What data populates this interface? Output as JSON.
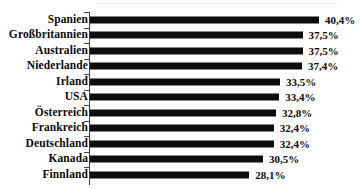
{
  "chart_data": {
    "type": "bar",
    "orientation": "horizontal",
    "title": "",
    "subtitle": "",
    "xlabel": "",
    "ylabel": "",
    "categories": [
      "Spanien",
      "Großbritannien",
      "Australien",
      "Niederlande",
      "Irland",
      "USA",
      "Österreich",
      "Frankreich",
      "Deutschland",
      "Kanada",
      "Finnland"
    ],
    "values": [
      40.4,
      37.5,
      37.5,
      37.4,
      33.5,
      33.4,
      32.8,
      32.4,
      32.4,
      30.5,
      28.1
    ],
    "value_labels": [
      "40,4%",
      "37,5%",
      "37,5%",
      "37,4%",
      "33,5%",
      "33,4%",
      "32,8%",
      "32,4%",
      "32,4%",
      "30,5%",
      "28,1%"
    ],
    "unit": "%",
    "decimal_separator": ",",
    "xlim": [
      0,
      40.4
    ],
    "grid": false,
    "legend": null,
    "bar_color": "#0d0d0d",
    "axis_color": "#3d3d3d",
    "background_color": "#ffffff",
    "label_color": "#0a0a0a"
  }
}
